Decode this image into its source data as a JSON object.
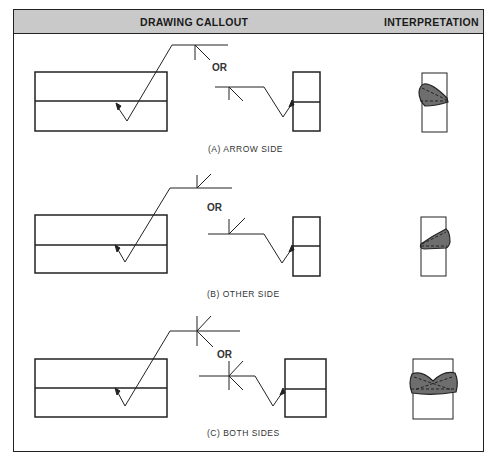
{
  "header": {
    "drawing_callout": "DRAWING CALLOUT",
    "interpretation": "INTERPRETATION"
  },
  "rows": [
    {
      "id": "A",
      "caption": "(A) ARROW SIDE",
      "or_label": "OR",
      "symbol": "fillet-weld-arrow-side"
    },
    {
      "id": "B",
      "caption": "(B) OTHER SIDE",
      "or_label": "OR",
      "symbol": "fillet-weld-other-side"
    },
    {
      "id": "C",
      "caption": "(C) BOTH SIDES",
      "or_label": "OR",
      "symbol": "fillet-weld-both-sides"
    }
  ],
  "colors": {
    "header_bg": "#c9c9c9",
    "line": "#222222",
    "weld_fill": "#6e6e6e"
  }
}
